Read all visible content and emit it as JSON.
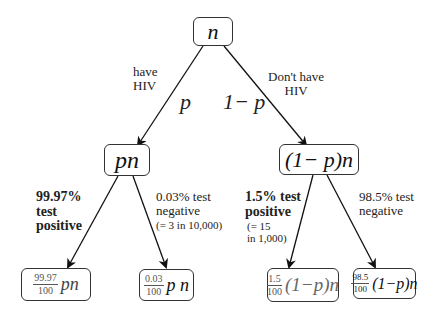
{
  "diagram": {
    "type": "probability-tree",
    "root": {
      "label": "n"
    },
    "level1": {
      "left": {
        "label": "pn",
        "edge_prob": "p",
        "edge_desc": [
          "have",
          "HIV"
        ]
      },
      "right": {
        "label": "(1− p)n",
        "edge_prob": "1− p",
        "edge_desc": [
          "Don't have",
          "HIV"
        ]
      }
    },
    "level2": {
      "left_left": {
        "edge_desc": [
          "99.97%",
          "test",
          "positive"
        ],
        "frac_num": "99.97",
        "frac_den": "100",
        "expr": "pn"
      },
      "left_right": {
        "edge_desc": [
          "0.03% test",
          "negative"
        ],
        "edge_note": "(= 3 in 10,000)",
        "frac_num": "0.03",
        "frac_den": "100",
        "expr": "p n"
      },
      "right_left": {
        "edge_desc": [
          "1.5% test",
          "positive"
        ],
        "edge_note": [
          "(= 15",
          "in 1,000)"
        ],
        "frac_num": "1.5",
        "frac_den": "100",
        "expr": "(1−p)n"
      },
      "right_right": {
        "edge_desc": [
          "98.5% test",
          "negative"
        ],
        "frac_num": "98.5",
        "frac_den": "100",
        "expr": "(1−p)n"
      }
    }
  }
}
